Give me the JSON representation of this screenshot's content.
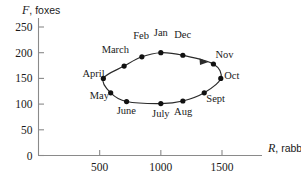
{
  "chart_data": {
    "type": "scatter",
    "title": "",
    "xlabel": "R, rabbits",
    "ylabel": "F, foxes",
    "xlabel_var": "R",
    "xlabel_rest": ", rabbits",
    "ylabel_var": "F",
    "ylabel_rest": ", foxes",
    "xlim": [
      0,
      1700
    ],
    "ylim": [
      0,
      265
    ],
    "grid": false,
    "legend": "none",
    "xticks": [
      500,
      1000,
      1500
    ],
    "xtick_labels": [
      "500",
      "1000",
      "1500"
    ],
    "yticks": [
      0,
      50,
      100,
      150,
      200,
      250
    ],
    "ytick_labels": [
      "0",
      "50",
      "100",
      "150",
      "200",
      "250"
    ],
    "annotation": "closed cycle with clockwise direction arrow between Dec and Nov",
    "points": [
      {
        "label": "Jan",
        "x": 1000,
        "y": 200,
        "lx": 1000,
        "ly": 232,
        "anchor": "middle"
      },
      {
        "label": "Feb",
        "x": 845,
        "y": 192,
        "lx": 838,
        "ly": 226,
        "anchor": "middle"
      },
      {
        "label": "March",
        "x": 700,
        "y": 174,
        "lx": 628,
        "ly": 199,
        "anchor": "middle"
      },
      {
        "label": "April",
        "x": 530,
        "y": 150,
        "lx": 450,
        "ly": 152,
        "anchor": "middle"
      },
      {
        "label": "May",
        "x": 590,
        "y": 122,
        "lx": 498,
        "ly": 110,
        "anchor": "middle"
      },
      {
        "label": "June",
        "x": 720,
        "y": 105,
        "lx": 718,
        "ly": 80,
        "anchor": "middle"
      },
      {
        "label": "July",
        "x": 1000,
        "y": 101,
        "lx": 1000,
        "ly": 74,
        "anchor": "middle"
      },
      {
        "label": "Aug",
        "x": 1180,
        "y": 106,
        "lx": 1182,
        "ly": 78,
        "anchor": "middle"
      },
      {
        "label": "Sept",
        "x": 1355,
        "y": 122,
        "lx": 1448,
        "ly": 104,
        "anchor": "middle"
      },
      {
        "label": "Oct",
        "x": 1490,
        "y": 150,
        "lx": 1580,
        "ly": 148,
        "anchor": "middle"
      },
      {
        "label": "Nov",
        "x": 1430,
        "y": 178,
        "lx": 1520,
        "ly": 190,
        "anchor": "middle"
      },
      {
        "label": "Dec",
        "x": 1180,
        "y": 195,
        "lx": 1178,
        "ly": 228,
        "anchor": "middle"
      }
    ]
  },
  "figure": {
    "background_color": "#ffffff",
    "axis_color": "#8a8a8a",
    "curve_color": "#2b2b2b",
    "dot_color": "#111111"
  }
}
